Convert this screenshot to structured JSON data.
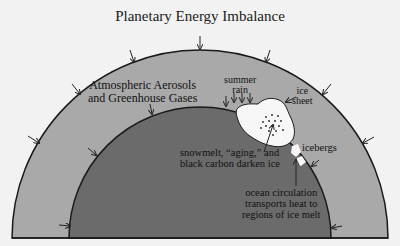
{
  "title": "Planetary Energy Imbalance",
  "labels": {
    "atmosphere_line1": "Atmospheric Aerosols",
    "atmosphere_line2": "and Greenhouse Gases",
    "summer_rain_line1": "summer",
    "summer_rain_line2": "rain",
    "ice_sheet_line1": "ice",
    "ice_sheet_line2": "sheet",
    "darken_line1": "snowmelt, “aging,” and",
    "darken_line2": "black carbon darken ice",
    "icebergs": "icebergs",
    "ocean_line1": "ocean circulation",
    "ocean_line2": "transports heat to",
    "ocean_line3": "regions of ice melt"
  },
  "colors": {
    "background": "#f2f2f2",
    "atmosphere": "#a9a9a9",
    "earth": "#6b6b6b",
    "ice": "#f7f7f7",
    "stroke": "#1a1a1a"
  }
}
